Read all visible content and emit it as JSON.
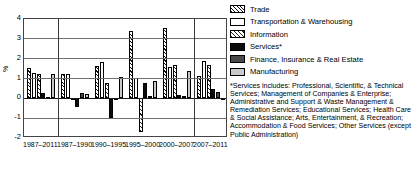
{
  "chart_data": {
    "type": "bar",
    "title": "",
    "xlabel": "",
    "ylabel": "%",
    "ylim": [
      -2,
      4
    ],
    "yticks": [
      4,
      3,
      2,
      1,
      0,
      -1,
      -2
    ],
    "grid": true,
    "legend_position": "right",
    "categories": [
      "1987–2011",
      "1987–1990",
      "1990–1995",
      "1995–2000",
      "2000–2007",
      "2007–2011"
    ],
    "series": [
      {
        "name": "Trade",
        "values": [
          1.55,
          1.23,
          1.62,
          3.38,
          3.55,
          1.15
        ]
      },
      {
        "name": "Transportation & Warehousing",
        "values": [
          1.3,
          1.22,
          1.82,
          1.05,
          1.57,
          1.88
        ]
      },
      {
        "name": "Information",
        "values": [
          1.25,
          0.0,
          0.78,
          -1.68,
          1.68,
          1.7
        ]
      },
      {
        "name": "Services*",
        "values": [
          0.26,
          -0.42,
          -0.97,
          0.78,
          0.15,
          0.48
        ]
      },
      {
        "name": "Finance, Insurance & Real Estate",
        "values": [
          0.08,
          0.25,
          0.0,
          0.1,
          0.14,
          0.3
        ]
      },
      {
        "name": "Manufacturing",
        "values": [
          1.23,
          0.2,
          1.09,
          0.85,
          1.4,
          0.02
        ]
      }
    ]
  },
  "legend": {
    "items": [
      {
        "label": "Trade",
        "pattern": "p-trade"
      },
      {
        "label": "Transportation & Warehousing",
        "pattern": "p-transport"
      },
      {
        "label": "Information",
        "pattern": "p-info"
      },
      {
        "label": "Services*",
        "pattern": "p-services"
      },
      {
        "label": "Finance, Insurance & Real Estate",
        "pattern": "p-finance"
      },
      {
        "label": "Manufacturing",
        "pattern": "p-manuf"
      }
    ],
    "footnote": "*Services includes: Professional, Scientific, & Technical Services; Management of Companies & Enterprise; Administrative and Support & Waste Management & Remediation Services; Educational Services; Health Care & Social Assistance; Arts, Entertainment, & Recreation; Accommodation & Food Services; Other Services (except Public Administration)"
  },
  "axis": {
    "y_label": "%",
    "y_ticks": [
      "4",
      "3",
      "2",
      "1",
      "0",
      "-1",
      "-2"
    ],
    "x_ticks": [
      "1987–2011",
      "1987–1990",
      "1990–1995",
      "1995–2000",
      "2000–2007",
      "2007–2011"
    ]
  },
  "colors": {
    "axis": "#444444",
    "grid": "#6f6f6f",
    "services": "#0b0b0b",
    "finance": "#4a4a4a",
    "manufacturing": "#c9c9c9"
  }
}
